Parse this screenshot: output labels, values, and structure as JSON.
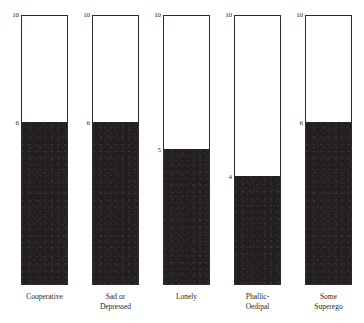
{
  "chart_data": {
    "type": "bar",
    "title": "",
    "subtitle": "",
    "xlabel": "",
    "ylabel": "",
    "ylim": [
      0,
      10
    ],
    "grid": false,
    "legend": null,
    "orientation": "vertical",
    "style": "outlined column filled from baseline, value tick printed at fill top",
    "axis_top_label": "10",
    "categories": [
      "Cooperative",
      "Sad or\nDepressed",
      "Lonely",
      "Phallic-\nOedipal",
      "Some\nSuperego"
    ],
    "values": [
      6,
      6,
      5,
      4,
      6
    ],
    "value_labels": [
      "6",
      "6",
      "5",
      "4",
      "6"
    ],
    "top_labels": [
      "10",
      "10",
      "10",
      "10",
      "10"
    ],
    "bars": [
      {
        "category": "Cooperative",
        "label_lines": [
          "Cooperative"
        ],
        "value": 6,
        "value_label": "6",
        "top_label": "10"
      },
      {
        "category": "Sad or Depressed",
        "label_lines": [
          "Sad or",
          "Depressed"
        ],
        "value": 6,
        "value_label": "6",
        "top_label": "10"
      },
      {
        "category": "Lonely",
        "label_lines": [
          "Lonely"
        ],
        "value": 5,
        "value_label": "5",
        "top_label": "10"
      },
      {
        "category": "Phallic-Oedipal",
        "label_lines": [
          "Phallic-",
          "Oedipal"
        ],
        "value": 4,
        "value_label": "4",
        "top_label": "10"
      },
      {
        "category": "Some Superego",
        "label_lines": [
          "Some",
          "Superego"
        ],
        "value": 6,
        "value_label": "6",
        "top_label": "10"
      }
    ],
    "colors": {
      "fill": "#231f20",
      "outline": "#2b2b2b",
      "background": "#ffffff",
      "text": "#1f1f1f"
    }
  }
}
